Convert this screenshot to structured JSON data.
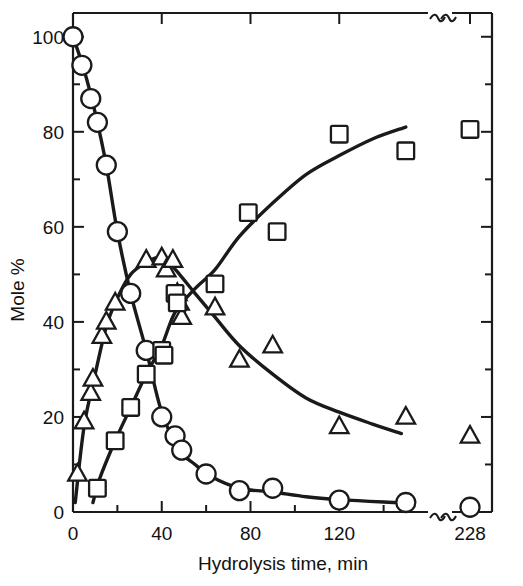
{
  "chart_data": {
    "type": "scatter",
    "title": "",
    "xlabel": "Hydrolysis time, min",
    "ylabel": "Mole %",
    "xlim": [
      0,
      160
    ],
    "ylim": [
      0,
      105
    ],
    "x_tick_labels": [
      "0",
      "40",
      "80",
      "120",
      "228"
    ],
    "x_ticks_major": [
      0,
      40,
      80,
      120
    ],
    "x_ticks_minor": [
      20,
      60,
      100,
      140
    ],
    "y_tick_labels": [
      "0",
      "20",
      "40",
      "60",
      "80",
      "100"
    ],
    "y_ticks_major": [
      0,
      20,
      40,
      60,
      80,
      100
    ],
    "y_ticks_minor": [
      10,
      30,
      50,
      70,
      90
    ],
    "grid": false,
    "legend": "none",
    "axis_break": {
      "present": true,
      "symbol": "double-squiggle",
      "location": "x-axis near right edge",
      "break_after": 150,
      "resumes_at_label": "228"
    },
    "series": [
      {
        "name": "circles",
        "marker": "open-circle",
        "trend": "decreasing",
        "points": [
          {
            "x": 0,
            "y": 100
          },
          {
            "x": 4,
            "y": 94
          },
          {
            "x": 8,
            "y": 87
          },
          {
            "x": 11,
            "y": 82
          },
          {
            "x": 15,
            "y": 73
          },
          {
            "x": 20,
            "y": 59
          },
          {
            "x": 26,
            "y": 46
          },
          {
            "x": 33,
            "y": 34
          },
          {
            "x": 40,
            "y": 20
          },
          {
            "x": 46,
            "y": 16
          },
          {
            "x": 49,
            "y": 13
          },
          {
            "x": 60,
            "y": 8
          },
          {
            "x": 75,
            "y": 4.5
          },
          {
            "x": 90,
            "y": 5
          },
          {
            "x": 120,
            "y": 2.5
          },
          {
            "x": 150,
            "y": 2
          },
          {
            "x": 228,
            "y": 1
          }
        ]
      },
      {
        "name": "triangles",
        "marker": "open-triangle",
        "trend": "rise-then-fall",
        "points": [
          {
            "x": 2,
            "y": 8
          },
          {
            "x": 5,
            "y": 19
          },
          {
            "x": 8,
            "y": 25
          },
          {
            "x": 9,
            "y": 28
          },
          {
            "x": 13,
            "y": 37
          },
          {
            "x": 15,
            "y": 40
          },
          {
            "x": 19,
            "y": 44
          },
          {
            "x": 33,
            "y": 53
          },
          {
            "x": 40,
            "y": 53.5
          },
          {
            "x": 42,
            "y": 51
          },
          {
            "x": 45,
            "y": 53
          },
          {
            "x": 47,
            "y": 46
          },
          {
            "x": 48,
            "y": 44
          },
          {
            "x": 49,
            "y": 41
          },
          {
            "x": 64,
            "y": 43
          },
          {
            "x": 75,
            "y": 32
          },
          {
            "x": 90,
            "y": 35
          },
          {
            "x": 120,
            "y": 18
          },
          {
            "x": 150,
            "y": 20
          },
          {
            "x": 228,
            "y": 16
          }
        ]
      },
      {
        "name": "squares",
        "marker": "open-square",
        "trend": "increasing",
        "points": [
          {
            "x": 11,
            "y": 5
          },
          {
            "x": 19,
            "y": 15
          },
          {
            "x": 26,
            "y": 22
          },
          {
            "x": 33,
            "y": 29
          },
          {
            "x": 40,
            "y": 34
          },
          {
            "x": 41,
            "y": 33
          },
          {
            "x": 46,
            "y": 46
          },
          {
            "x": 47,
            "y": 44
          },
          {
            "x": 64,
            "y": 48
          },
          {
            "x": 79,
            "y": 63
          },
          {
            "x": 92,
            "y": 59
          },
          {
            "x": 120,
            "y": 79.5
          },
          {
            "x": 150,
            "y": 76
          },
          {
            "x": 228,
            "y": 80.5
          }
        ]
      }
    ],
    "fitted_curves": [
      {
        "name": "circles-curve",
        "path": [
          {
            "x": 0,
            "y": 100
          },
          {
            "x": 5,
            "y": 93
          },
          {
            "x": 10,
            "y": 84
          },
          {
            "x": 15,
            "y": 73
          },
          {
            "x": 20,
            "y": 59
          },
          {
            "x": 26,
            "y": 46
          },
          {
            "x": 33,
            "y": 34
          },
          {
            "x": 40,
            "y": 21
          },
          {
            "x": 48,
            "y": 13
          },
          {
            "x": 55,
            "y": 10
          },
          {
            "x": 62,
            "y": 7.5
          },
          {
            "x": 75,
            "y": 5
          },
          {
            "x": 90,
            "y": 4.2
          },
          {
            "x": 105,
            "y": 3.2
          },
          {
            "x": 120,
            "y": 2.6
          },
          {
            "x": 140,
            "y": 2.1
          },
          {
            "x": 152,
            "y": 1.9
          }
        ]
      },
      {
        "name": "triangles-curve",
        "path": [
          {
            "x": 1,
            "y": 2
          },
          {
            "x": 5,
            "y": 18
          },
          {
            "x": 10,
            "y": 29
          },
          {
            "x": 15,
            "y": 39
          },
          {
            "x": 20,
            "y": 45
          },
          {
            "x": 26,
            "y": 50
          },
          {
            "x": 33,
            "y": 52.5
          },
          {
            "x": 38,
            "y": 53.5
          },
          {
            "x": 43,
            "y": 52.5
          },
          {
            "x": 48,
            "y": 50
          },
          {
            "x": 55,
            "y": 46
          },
          {
            "x": 64,
            "y": 41
          },
          {
            "x": 75,
            "y": 35
          },
          {
            "x": 90,
            "y": 29
          },
          {
            "x": 105,
            "y": 24
          },
          {
            "x": 120,
            "y": 21
          },
          {
            "x": 135,
            "y": 18.5
          },
          {
            "x": 148,
            "y": 16.5
          }
        ]
      },
      {
        "name": "squares-curve",
        "path": [
          {
            "x": 9,
            "y": 2
          },
          {
            "x": 12,
            "y": 7
          },
          {
            "x": 19,
            "y": 15
          },
          {
            "x": 26,
            "y": 22
          },
          {
            "x": 33,
            "y": 29
          },
          {
            "x": 40,
            "y": 35
          },
          {
            "x": 46,
            "y": 42
          },
          {
            "x": 55,
            "y": 47
          },
          {
            "x": 64,
            "y": 51
          },
          {
            "x": 75,
            "y": 58
          },
          {
            "x": 90,
            "y": 65
          },
          {
            "x": 105,
            "y": 71
          },
          {
            "x": 120,
            "y": 75
          },
          {
            "x": 135,
            "y": 78.5
          },
          {
            "x": 150,
            "y": 81
          }
        ]
      }
    ],
    "marker_legend_semantics": {
      "circle": "starting material",
      "triangle": "intermediate",
      "square": "product"
    }
  },
  "axes": {
    "x_title": "Hydrolysis time, min",
    "y_title": "Mole %",
    "x_labels": [
      "0",
      "40",
      "80",
      "120",
      "228"
    ],
    "y_labels": [
      "0",
      "20",
      "40",
      "60",
      "80",
      "100"
    ]
  }
}
